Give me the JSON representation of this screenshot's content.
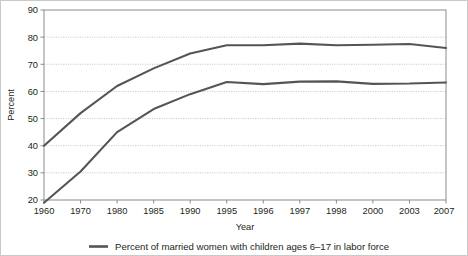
{
  "chart_data": {
    "type": "line",
    "title": "",
    "xlabel": "Year",
    "ylabel": "Percent",
    "categories": [
      "1960",
      "1970",
      "1980",
      "1985",
      "1990",
      "1995",
      "1996",
      "1997",
      "1998",
      "2000",
      "2003",
      "2007"
    ],
    "ylim": [
      20,
      90
    ],
    "yticks": [
      20,
      30,
      40,
      50,
      60,
      70,
      80,
      90
    ],
    "ytick_labels": [
      "20",
      "30",
      "40",
      "50",
      "60",
      "70",
      "80",
      "90"
    ],
    "grid": "horizontal-dotted",
    "legend_position": "bottom-center",
    "series": [
      {
        "name": "Percent of married women with children ages 6–17 in labor force",
        "color": "#555555",
        "values": [
          40,
          52,
          62,
          68.5,
          74,
          77,
          77,
          77.6,
          77,
          77.2,
          77.5,
          76
        ]
      },
      {
        "name": "Percent of married women with children under age 6 in labor force",
        "color": "#555555",
        "values": [
          19,
          30.5,
          45,
          53.5,
          59,
          63.5,
          62.7,
          63.6,
          63.7,
          62.8,
          62.9,
          63.3
        ]
      }
    ],
    "legend": [
      {
        "label": "Percent of married women with children ages 6–17 in labor force",
        "color": "#555555",
        "marker": "line-swatch"
      }
    ]
  },
  "colors": {
    "line": "#555555",
    "frame": "#8b8b8b",
    "grid": "#bdbdbd",
    "text": "#231f20",
    "background": "#ffffff",
    "border": "#c9c9c9"
  }
}
